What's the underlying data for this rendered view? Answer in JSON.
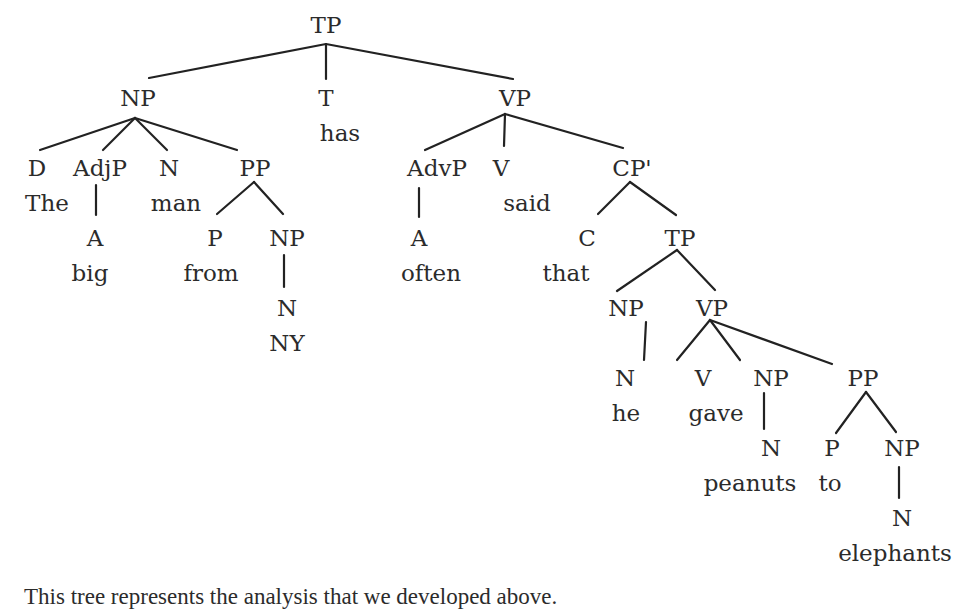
{
  "diagram": {
    "type": "syntax-tree",
    "sentence": "The big man from NY has often said that he gave peanuts to elephants",
    "colors": {
      "text": "#2b2b2b",
      "edge": "#222222",
      "background": "#ffffff"
    },
    "nodes": [
      {
        "id": "tp_root",
        "label": "TP",
        "x": 326,
        "y": 14
      },
      {
        "id": "np_subj",
        "label": "NP",
        "x": 138,
        "y": 87
      },
      {
        "id": "t",
        "label": "T",
        "x": 326,
        "y": 87
      },
      {
        "id": "t_word",
        "label": "has",
        "x": 340,
        "y": 122
      },
      {
        "id": "vp_main",
        "label": "VP",
        "x": 515,
        "y": 87
      },
      {
        "id": "d",
        "label": "D",
        "x": 37,
        "y": 157
      },
      {
        "id": "d_word",
        "label": "The",
        "x": 47,
        "y": 192
      },
      {
        "id": "adjp",
        "label": "AdjP",
        "x": 100,
        "y": 157
      },
      {
        "id": "a_big",
        "label": "A",
        "x": 95,
        "y": 227
      },
      {
        "id": "a_big_word",
        "label": "big",
        "x": 90,
        "y": 262
      },
      {
        "id": "n_man",
        "label": "N",
        "x": 169,
        "y": 157
      },
      {
        "id": "n_man_word",
        "label": "man",
        "x": 176,
        "y": 192
      },
      {
        "id": "pp_from",
        "label": "PP",
        "x": 255,
        "y": 157
      },
      {
        "id": "p_from",
        "label": "P",
        "x": 215,
        "y": 227
      },
      {
        "id": "p_from_word",
        "label": "from",
        "x": 211,
        "y": 262
      },
      {
        "id": "np_ny",
        "label": "NP",
        "x": 287,
        "y": 227
      },
      {
        "id": "n_ny",
        "label": "N",
        "x": 287,
        "y": 297
      },
      {
        "id": "n_ny_word",
        "label": "NY",
        "x": 287,
        "y": 332
      },
      {
        "id": "advp",
        "label": "AdvP",
        "x": 437,
        "y": 157
      },
      {
        "id": "a_often",
        "label": "A",
        "x": 419,
        "y": 227
      },
      {
        "id": "a_often_word",
        "label": "often",
        "x": 431,
        "y": 262
      },
      {
        "id": "v_said",
        "label": "V",
        "x": 501,
        "y": 157
      },
      {
        "id": "v_said_word",
        "label": "said",
        "x": 527,
        "y": 192
      },
      {
        "id": "cp_bar",
        "label": "CP'",
        "x": 632,
        "y": 157
      },
      {
        "id": "c",
        "label": "C",
        "x": 587,
        "y": 227
      },
      {
        "id": "c_word",
        "label": "that",
        "x": 566,
        "y": 262
      },
      {
        "id": "tp_emb",
        "label": "TP",
        "x": 680,
        "y": 227
      },
      {
        "id": "np_he",
        "label": "NP",
        "x": 626,
        "y": 297
      },
      {
        "id": "n_he",
        "label": "N",
        "x": 625,
        "y": 367
      },
      {
        "id": "n_he_word",
        "label": "he",
        "x": 626,
        "y": 402
      },
      {
        "id": "vp_emb",
        "label": "VP",
        "x": 712,
        "y": 297
      },
      {
        "id": "v_gave",
        "label": "V",
        "x": 703,
        "y": 367
      },
      {
        "id": "v_gave_word",
        "label": "gave",
        "x": 716,
        "y": 402
      },
      {
        "id": "np_peanuts",
        "label": "NP",
        "x": 771,
        "y": 367
      },
      {
        "id": "n_peanuts",
        "label": "N",
        "x": 771,
        "y": 437
      },
      {
        "id": "n_peanuts_word",
        "label": "peanuts",
        "x": 750,
        "y": 472
      },
      {
        "id": "pp_to",
        "label": "PP",
        "x": 863,
        "y": 367
      },
      {
        "id": "p_to",
        "label": "P",
        "x": 832,
        "y": 437
      },
      {
        "id": "p_to_word",
        "label": "to",
        "x": 830,
        "y": 472
      },
      {
        "id": "np_elephants",
        "label": "NP",
        "x": 902,
        "y": 437
      },
      {
        "id": "n_elephants",
        "label": "N",
        "x": 902,
        "y": 507
      },
      {
        "id": "n_elephants_word",
        "label": "elephants",
        "x": 895,
        "y": 542
      }
    ],
    "edges": [
      {
        "x1": 326,
        "y1": 44,
        "x2": 149,
        "y2": 78
      },
      {
        "x1": 326,
        "y1": 44,
        "x2": 326,
        "y2": 79
      },
      {
        "x1": 326,
        "y1": 44,
        "x2": 513,
        "y2": 79
      },
      {
        "x1": 135,
        "y1": 118,
        "x2": 40,
        "y2": 150
      },
      {
        "x1": 135,
        "y1": 118,
        "x2": 103,
        "y2": 150
      },
      {
        "x1": 135,
        "y1": 118,
        "x2": 167,
        "y2": 150
      },
      {
        "x1": 135,
        "y1": 118,
        "x2": 237,
        "y2": 150
      },
      {
        "x1": 96,
        "y1": 185,
        "x2": 96,
        "y2": 215
      },
      {
        "x1": 254,
        "y1": 182,
        "x2": 217,
        "y2": 214
      },
      {
        "x1": 254,
        "y1": 182,
        "x2": 283,
        "y2": 214
      },
      {
        "x1": 284,
        "y1": 255,
        "x2": 284,
        "y2": 287
      },
      {
        "x1": 505,
        "y1": 114,
        "x2": 425,
        "y2": 150
      },
      {
        "x1": 505,
        "y1": 114,
        "x2": 504,
        "y2": 146
      },
      {
        "x1": 505,
        "y1": 114,
        "x2": 623,
        "y2": 148
      },
      {
        "x1": 419,
        "y1": 188,
        "x2": 419,
        "y2": 217
      },
      {
        "x1": 630,
        "y1": 182,
        "x2": 598,
        "y2": 214
      },
      {
        "x1": 630,
        "y1": 182,
        "x2": 676,
        "y2": 215
      },
      {
        "x1": 677,
        "y1": 250,
        "x2": 617,
        "y2": 291
      },
      {
        "x1": 677,
        "y1": 250,
        "x2": 715,
        "y2": 290
      },
      {
        "x1": 646,
        "y1": 322,
        "x2": 644,
        "y2": 360
      },
      {
        "x1": 710,
        "y1": 320,
        "x2": 677,
        "y2": 360
      },
      {
        "x1": 710,
        "y1": 320,
        "x2": 740,
        "y2": 360
      },
      {
        "x1": 710,
        "y1": 320,
        "x2": 832,
        "y2": 364
      },
      {
        "x1": 764,
        "y1": 393,
        "x2": 764,
        "y2": 429
      },
      {
        "x1": 866,
        "y1": 392,
        "x2": 836,
        "y2": 433
      },
      {
        "x1": 866,
        "y1": 392,
        "x2": 896,
        "y2": 432
      },
      {
        "x1": 899,
        "y1": 467,
        "x2": 899,
        "y2": 498
      }
    ]
  },
  "caption": {
    "text": "This tree represents the analysis that we developed above."
  }
}
